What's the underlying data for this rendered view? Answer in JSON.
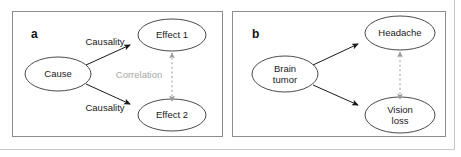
{
  "figure": {
    "width": 461,
    "height": 157,
    "background": "#ffffff",
    "frame_color": "#c9c9c9",
    "panel_border_color": "#8d8d8d",
    "node_stroke_color": "#4a4a4a",
    "arrow_color": "#1a1a1a",
    "dashed_arrow_color": "#9b9b9b",
    "muted_text_color": "#a8a8a8"
  },
  "panels": [
    {
      "id": "a",
      "letter": "a",
      "nodes": [
        {
          "id": "cause",
          "label": "Cause",
          "cx": 58,
          "cy": 74,
          "rx": 33,
          "ry": 17
        },
        {
          "id": "effect1",
          "label": "Effect 1",
          "cx": 172,
          "cy": 35,
          "rx": 34,
          "ry": 16
        },
        {
          "id": "effect2",
          "label": "Effect 2",
          "cx": 172,
          "cy": 115,
          "rx": 34,
          "ry": 16
        }
      ],
      "edges": [
        {
          "id": "cause-to-effect1",
          "from": "cause",
          "to": "effect1",
          "label": "Causality",
          "style": "solid",
          "arrow": "single",
          "label_x": 105,
          "label_y": 41
        },
        {
          "id": "cause-to-effect2",
          "from": "cause",
          "to": "effect2",
          "label": "Causality",
          "style": "solid",
          "arrow": "single",
          "label_x": 105,
          "label_y": 107
        },
        {
          "id": "effect1-effect2",
          "from": "effect2",
          "to": "effect1",
          "label": "Correlation",
          "style": "dashed",
          "arrow": "double",
          "label_x": 139,
          "label_y": 74,
          "muted": true
        }
      ]
    },
    {
      "id": "b",
      "letter": "b",
      "nodes": [
        {
          "id": "brain-tumor",
          "label": "Brain\ntumor",
          "cx": 285,
          "cy": 74,
          "rx": 33,
          "ry": 18
        },
        {
          "id": "headache",
          "label": "Headache",
          "cx": 400,
          "cy": 33,
          "rx": 35,
          "ry": 17
        },
        {
          "id": "vision-loss",
          "label": "Vision\nloss",
          "cx": 400,
          "cy": 115,
          "rx": 35,
          "ry": 18
        }
      ],
      "edges": [
        {
          "id": "tumor-to-headache",
          "from": "brain-tumor",
          "to": "headache",
          "label": "",
          "style": "solid",
          "arrow": "single"
        },
        {
          "id": "tumor-to-vision-loss",
          "from": "brain-tumor",
          "to": "vision-loss",
          "label": "",
          "style": "solid",
          "arrow": "single"
        },
        {
          "id": "headache-vision-loss",
          "from": "vision-loss",
          "to": "headache",
          "label": "",
          "style": "dashed",
          "arrow": "double"
        }
      ]
    }
  ],
  "labels": {
    "panel_a_letter": "a",
    "panel_b_letter": "b",
    "cause": "Cause",
    "effect1": "Effect 1",
    "effect2": "Effect 2",
    "causality_top": "Causality",
    "causality_bottom": "Causality",
    "correlation": "Correlation",
    "brain_tumor": "Brain\ntumor",
    "headache": "Headache",
    "vision_loss": "Vision\nloss"
  }
}
